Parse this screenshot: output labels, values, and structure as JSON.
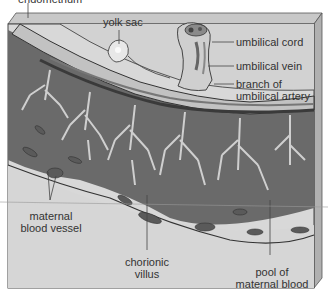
{
  "diagram": {
    "type": "anatomical cross-section",
    "labels": {
      "top_cut": "endometrium",
      "yolk_sac": "yolk sac",
      "umbilical_cord": "umbilical cord",
      "umbilical_vein": "umbilical vein",
      "branch_artery_1": "branch of",
      "branch_artery_2": "umbilical artery",
      "maternal_vessel_1": "maternal",
      "maternal_vessel_2": "blood vessel",
      "chorionic_1": "chorionic",
      "chorionic_2": "villus",
      "pool_1": "pool of",
      "pool_2": "maternal blood"
    },
    "colors": {
      "tissue_light": "#d4d4d4",
      "tissue_mid": "#a8a8a8",
      "villus_dark": "#5e5e5e",
      "outline": "#2e2e2e",
      "bevel": "#bcbcbc",
      "leader": "#444444"
    }
  }
}
